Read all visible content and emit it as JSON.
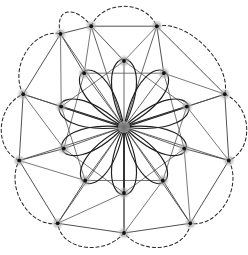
{
  "figure": {
    "background_color": "#ffffff",
    "canvas": {
      "width": 248,
      "height": 255
    },
    "symmetry_order": 10,
    "center": {
      "x": 124,
      "y": 127
    }
  },
  "chart_data": {
    "type": "scatter",
    "subtitle": "",
    "xlabel": "",
    "ylabel": "",
    "xlim": [
      0,
      248
    ],
    "ylim": [
      0,
      255
    ],
    "grid": false,
    "legend_position": "none",
    "annotations": [],
    "tick_labels": {
      "x": [],
      "y": []
    },
    "layers": [
      {
        "name": "hub",
        "node_count": 1,
        "radius": 0,
        "nodes": [
          {
            "id": "h0",
            "label": "hub",
            "x": 124,
            "y": 127
          }
        ]
      },
      {
        "name": "inner-ring",
        "node_count": 10,
        "radius": 66,
        "angle_offset_deg": -90,
        "nodes": [
          {
            "id": "i0",
            "label": "i0",
            "x": 124,
            "y": 61
          },
          {
            "id": "i1",
            "label": "i1",
            "x": 186.8,
            "y": 106.6
          },
          {
            "id": "i2",
            "label": "i2",
            "x": 162.8,
            "y": 180.5
          },
          {
            "id": "i3",
            "label": "i3",
            "x": 85.2,
            "y": 180.5
          },
          {
            "id": "i4",
            "label": "i4",
            "x": 61.2,
            "y": 106.6
          },
          {
            "id": "i5",
            "label": "i5",
            "x": 163.8,
            "y": 73.2
          },
          {
            "id": "i6",
            "label": "i6",
            "x": 184.2,
            "y": 148.6
          },
          {
            "id": "i7",
            "label": "i7",
            "x": 124,
            "y": 193
          },
          {
            "id": "i8",
            "label": "i8",
            "x": 63.8,
            "y": 148.6
          },
          {
            "id": "i9",
            "label": "i9",
            "x": 84.2,
            "y": 73.2
          }
        ]
      },
      {
        "name": "outer-ring",
        "node_count": 10,
        "radius": 106,
        "angle_offset_deg": -72,
        "nodes": [
          {
            "id": "o0",
            "label": "o0",
            "x": 156.8,
            "y": 26.2
          },
          {
            "id": "o1",
            "label": "o1",
            "x": 224.8,
            "y": 94.2
          },
          {
            "id": "o2",
            "label": "o2",
            "x": 228.8,
            "y": 160.5
          },
          {
            "id": "o3",
            "label": "o3",
            "x": 190.3,
            "y": 223.3
          },
          {
            "id": "o4",
            "label": "o4",
            "x": 124,
            "y": 233
          },
          {
            "id": "o5",
            "label": "o5",
            "x": 57.7,
            "y": 223.3
          },
          {
            "id": "o6",
            "label": "o6",
            "x": 19.2,
            "y": 160.5
          },
          {
            "id": "o7",
            "label": "o7",
            "x": 23.2,
            "y": 94.2
          },
          {
            "id": "o8",
            "label": "o8",
            "x": 60.5,
            "y": 33.8
          },
          {
            "id": "o9",
            "label": "o9",
            "x": 91.2,
            "y": 26.2
          }
        ]
      }
    ],
    "edge_classes": [
      {
        "name": "radial-spoke",
        "style": "solid-thin",
        "color": "#4a4a4a",
        "count": 20
      },
      {
        "name": "radial-spoke-emphasis",
        "style": "solid-thick",
        "color": "#1a1a1a",
        "count": 3
      },
      {
        "name": "inner-chord",
        "style": "solid-thin",
        "color": "#555555",
        "count": 10
      },
      {
        "name": "outer-chord",
        "style": "solid-thin",
        "color": "#3d3d3d",
        "count": 10
      },
      {
        "name": "petal-loop",
        "style": "solid-curve",
        "color": "#1f1f1f",
        "count": 10
      },
      {
        "name": "outer-dashed-arc",
        "style": "dashed-curve",
        "color": "#2b2b2b",
        "count": 10
      }
    ]
  },
  "colors": {
    "background": "#ffffff",
    "node_core": "#111111",
    "node_halo": "#9a9a9a",
    "edge_thin": "#4a4a4a",
    "edge_bold": "#1a1a1a",
    "edge_petal": "#1f1f1f",
    "edge_dashed": "#2b2b2b",
    "hub_core": "#6f6f6f"
  }
}
